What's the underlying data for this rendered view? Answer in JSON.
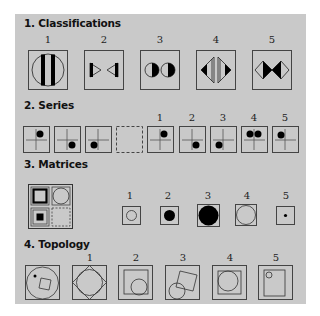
{
  "sections": {
    "classifications": {
      "title": "1. Classifications",
      "options": [
        "1",
        "2",
        "3",
        "4",
        "5"
      ],
      "figures": [
        "circle-with-two-bars",
        "bowtie-triangles",
        "two-half-filled-circles",
        "outward-half-diamonds",
        "two-half-filled-diamonds"
      ]
    },
    "series": {
      "title": "2. Series",
      "sequence": [
        "dot-top-right",
        "dot-bottom-right",
        "dot-bottom-left",
        "blank"
      ],
      "options": [
        "1",
        "2",
        "3",
        "4",
        "5"
      ],
      "option_figures": [
        "dot-top-right",
        "dot-bottom-right",
        "dot-bottom-left",
        "two-dots-top",
        "dot-top-left"
      ]
    },
    "matrices": {
      "title": "3. Matrices",
      "grid": [
        "thick-square",
        "circle",
        "filled-square",
        "blank"
      ],
      "options": [
        "1",
        "2",
        "3",
        "4",
        "5"
      ],
      "option_figures": [
        "small-hollow-circle",
        "medium-black-circle",
        "large-black-circle",
        "large-hollow-circle",
        "tiny-black-dot"
      ]
    },
    "topology": {
      "title": "4. Topology",
      "options": [
        "1",
        "2",
        "3",
        "4",
        "5"
      ],
      "option_figures": [
        "diamond-in-square",
        "circle-in-square-in-square",
        "circle-overlapping-square",
        "circle-in-square",
        "circle-in-rectangle"
      ]
    }
  },
  "colors": {
    "panel": "#c9c9c9",
    "ink": "#000000",
    "line": "#555555"
  }
}
